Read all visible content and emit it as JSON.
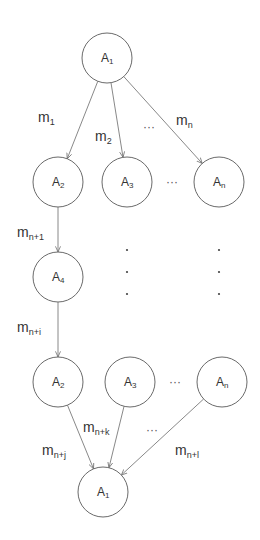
{
  "diagram": {
    "colors": {
      "stroke": "#6a6a6a",
      "text": "#333333",
      "background": "#ffffff"
    },
    "nodes": [
      {
        "id": "top_a1",
        "base": "A",
        "sub": "1",
        "cx": 107,
        "cy": 58,
        "r": 25
      },
      {
        "id": "r2_a2",
        "base": "A",
        "sub": "2",
        "cx": 58,
        "cy": 182,
        "r": 25
      },
      {
        "id": "r2_a3",
        "base": "A",
        "sub": "3",
        "cx": 127,
        "cy": 182,
        "r": 25
      },
      {
        "id": "r2_an",
        "base": "A",
        "sub": "n",
        "cx": 219,
        "cy": 182,
        "r": 25
      },
      {
        "id": "r3_a4",
        "base": "A",
        "sub": "4",
        "cx": 58,
        "cy": 277,
        "r": 25
      },
      {
        "id": "r4_a2",
        "base": "A",
        "sub": "2",
        "cx": 58,
        "cy": 382,
        "r": 25
      },
      {
        "id": "r4_a3",
        "base": "A",
        "sub": "3",
        "cx": 130,
        "cy": 382,
        "r": 25
      },
      {
        "id": "r4_an",
        "base": "A",
        "sub": "n",
        "cx": 222,
        "cy": 382,
        "r": 25
      },
      {
        "id": "bot_a1",
        "base": "A",
        "sub": "1",
        "cx": 103,
        "cy": 492,
        "r": 25
      }
    ],
    "edges": [
      {
        "from": "top_a1",
        "to": "r2_a2",
        "label_base": "m",
        "label_sub": "1",
        "lx": 38,
        "ly": 122
      },
      {
        "from": "top_a1",
        "to": "r2_a3",
        "label_base": "m",
        "label_sub": "2",
        "lx": 95,
        "ly": 141
      },
      {
        "from": "top_a1",
        "to": "r2_an",
        "label_base": "m",
        "label_sub": "n",
        "lx": 176,
        "ly": 125
      },
      {
        "from": "r2_a2",
        "to": "r3_a4",
        "label_base": "m",
        "label_sub": "n+1",
        "lx": 17,
        "ly": 237
      },
      {
        "from": "r3_a4",
        "to": "r4_a2",
        "label_base": "m",
        "label_sub": "n+i",
        "lx": 17,
        "ly": 332
      },
      {
        "from": "r4_a2",
        "to": "bot_a1",
        "label_base": "m",
        "label_sub": "n+j",
        "lx": 42,
        "ly": 455
      },
      {
        "from": "r4_a3",
        "to": "bot_a1",
        "label_base": "m",
        "label_sub": "n+k",
        "lx": 83,
        "ly": 432
      },
      {
        "from": "r4_an",
        "to": "bot_a1",
        "label_base": "m",
        "label_sub": "n+l",
        "lx": 175,
        "ly": 455
      }
    ],
    "ellipses": [
      {
        "text": "···",
        "x": 143,
        "y": 131
      },
      {
        "text": "···",
        "x": 166,
        "y": 186
      },
      {
        "text": "···",
        "x": 169,
        "y": 386
      },
      {
        "text": "···",
        "x": 146,
        "y": 434
      }
    ],
    "vertical_dots": [
      {
        "x": 127,
        "ys": [
          250,
          272,
          294
        ]
      },
      {
        "x": 219,
        "ys": [
          250,
          272,
          294
        ]
      }
    ]
  }
}
